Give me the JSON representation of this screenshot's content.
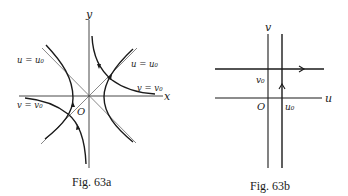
{
  "figures": [
    {
      "id": "fig-63a",
      "caption": "Fig. 63a",
      "axes": {
        "x_label": "x",
        "y_label": "y",
        "origin_label": "O"
      },
      "curve_labels": {
        "u_upper_left": "u = u₀",
        "u_right": "u = u₀",
        "v_right": "v = v₀",
        "v_left": "v = v₀"
      },
      "description": "Hyperbolas u = u0 and v = v0 in the xy-plane with asymptotes y = ±x, directed by arrows"
    },
    {
      "id": "fig-63b",
      "caption": "Fig. 63b",
      "axes": {
        "u_label": "u",
        "v_label": "v",
        "origin_label": "O"
      },
      "line_labels": {
        "v0": "v₀",
        "u0": "u₀"
      },
      "description": "Straight lines u = u0 (vertical) and v = v0 (horizontal) in the uv-plane, directed by arrows"
    }
  ],
  "colors": {
    "ink": "#1a1a1a",
    "background": "#ffffff"
  }
}
